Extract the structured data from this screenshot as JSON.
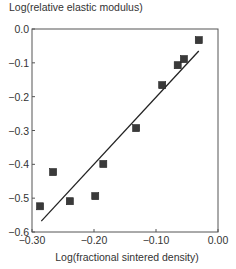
{
  "chart_data": {
    "type": "scatter",
    "title": "",
    "xlabel": "Log(fractional sintered density)",
    "ylabel": "Log(relative elastic modulus)",
    "xlim": [
      -0.3,
      0.0
    ],
    "ylim": [
      -0.6,
      0.0
    ],
    "x_ticks": [
      -0.3,
      -0.2,
      -0.1,
      0.0
    ],
    "x_tick_labels": [
      "−0.30",
      "−0.20",
      "−0.10",
      "0.00"
    ],
    "y_ticks": [
      0.0,
      -0.1,
      -0.2,
      -0.3,
      -0.4,
      -0.5,
      -0.6
    ],
    "y_tick_labels": [
      "0.0",
      "−0.1",
      "−0.2",
      "−0.3",
      "−0.4",
      "−0.5",
      "−0.6"
    ],
    "grid": false,
    "legend": null,
    "series": [
      {
        "name": "measured",
        "marker": "square",
        "color": "#3a3a3a",
        "points": [
          {
            "x": -0.287,
            "y": -0.524
          },
          {
            "x": -0.266,
            "y": -0.423
          },
          {
            "x": -0.239,
            "y": -0.509
          },
          {
            "x": -0.198,
            "y": -0.494
          },
          {
            "x": -0.185,
            "y": -0.399
          },
          {
            "x": -0.132,
            "y": -0.293
          },
          {
            "x": -0.09,
            "y": -0.166
          },
          {
            "x": -0.065,
            "y": -0.107
          },
          {
            "x": -0.055,
            "y": -0.089
          },
          {
            "x": -0.031,
            "y": -0.033
          }
        ]
      },
      {
        "name": "linear fit",
        "type": "line",
        "color": "#222222",
        "points": [
          {
            "x": -0.285,
            "y": -0.568
          },
          {
            "x": -0.031,
            "y": -0.065
          }
        ]
      }
    ]
  }
}
